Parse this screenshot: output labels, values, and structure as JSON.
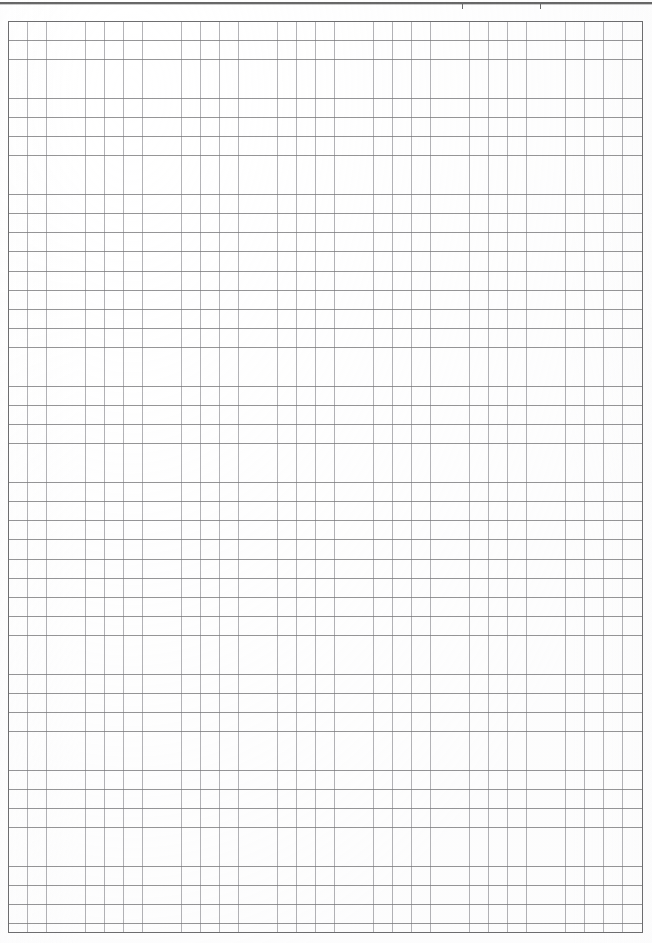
{
  "document": {
    "kind": "scanned-grid-paper",
    "page_width": 652,
    "page_height": 943,
    "background_color": "#ffffff",
    "content_text": ""
  },
  "top_rule": {
    "name": "horizontal-rule",
    "color": "#4f4f4f",
    "thickness": 2,
    "y": 2,
    "x_start": 0,
    "x_end": 652,
    "ticks": [
      {
        "label": "tick-1",
        "x": 462,
        "height": 7,
        "color": "#6a6a6a"
      },
      {
        "label": "tick-2",
        "x": 540,
        "height": 7,
        "color": "#6a6a6a"
      }
    ]
  },
  "grid": {
    "name": "quadrille-grid",
    "x": 8,
    "y": 21,
    "width": 635,
    "height": 912,
    "cell_size": 19.2,
    "columns": 33,
    "rows": 47,
    "horizontal_line_color": "#78787a",
    "vertical_line_color": "#96969b",
    "frame_color": "#6e6e70"
  }
}
